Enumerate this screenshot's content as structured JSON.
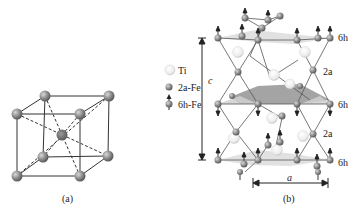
{
  "panel_a": {
    "caption": "(a)",
    "description": "Body-centered cubic cell with corner atoms and center atom",
    "corner_atom_color": "#8a8a8a",
    "center_atom_color": "#6e6e6e"
  },
  "legend": {
    "items": [
      {
        "label": "Ti",
        "icon": "white-sphere-icon",
        "color": "#f2f2f2"
      },
      {
        "label": "2a-Fe",
        "icon": "gray-sphere-icon",
        "color": "#8c8c8c"
      },
      {
        "label": "6h-Fe",
        "icon": "gray-sphere-with-spin-arrow-icon",
        "color": "#8c8c8c"
      }
    ]
  },
  "panel_b": {
    "caption": "(b)",
    "c_axis_label": "c",
    "a_axis_label": "a",
    "site_labels": [
      "6h",
      "2a",
      "6h",
      "2a",
      "6h"
    ],
    "plane_color": "#d9d9d9",
    "middle_plane_color": "#9a9a9a"
  }
}
